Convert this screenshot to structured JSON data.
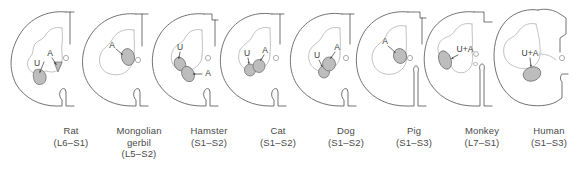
{
  "figure": {
    "type": "anatomical-diagram",
    "nucleus_legend": {
      "U": "U",
      "A": "A",
      "UA": "U+A"
    }
  },
  "panels": [
    {
      "id": "rat",
      "species": "Rat",
      "segments": "(L6–S1)",
      "nuclei": [
        "U",
        "A"
      ],
      "nucleus_labels": [
        "U",
        "A"
      ],
      "separate_nuclei": true
    },
    {
      "id": "mongolian-gerbil",
      "species": "Mongolian gerbil",
      "species_lines": [
        "Mongolian",
        "gerbil"
      ],
      "segments": "(L5–S2)",
      "nuclei": [
        "A"
      ],
      "nucleus_labels": [
        "A"
      ],
      "separate_nuclei": false
    },
    {
      "id": "hamster",
      "species": "Hamster",
      "segments": "(S1–S2)",
      "nuclei": [
        "U",
        "A"
      ],
      "nucleus_labels": [
        "U",
        "A"
      ],
      "separate_nuclei": true
    },
    {
      "id": "cat",
      "species": "Cat",
      "segments": "(S1–S2)",
      "nuclei": [
        "U",
        "A"
      ],
      "nucleus_labels": [
        "U",
        "A"
      ],
      "separate_nuclei": true
    },
    {
      "id": "dog",
      "species": "Dog",
      "segments": "(S1–S2)",
      "nuclei": [
        "U",
        "A"
      ],
      "nucleus_labels": [
        "U",
        "A"
      ],
      "separate_nuclei": true
    },
    {
      "id": "pig",
      "species": "Pig",
      "segments": "(S1–S3)",
      "nuclei": [
        "A"
      ],
      "nucleus_labels": [
        "A"
      ],
      "separate_nuclei": false
    },
    {
      "id": "monkey",
      "species": "Monkey",
      "segments": "(L7–S1)",
      "nuclei": [
        "U+A"
      ],
      "nucleus_labels": [
        "U+A"
      ],
      "separate_nuclei": false
    },
    {
      "id": "human",
      "species": "Human",
      "segments": "(S1–S3)",
      "nuclei": [
        "U+A"
      ],
      "nucleus_labels": [
        "U+A"
      ],
      "separate_nuclei": false
    }
  ],
  "colors": {
    "cord_outline": "#5a5a5a",
    "gray_matter": "#b2b2b2",
    "nucleus_fill": "#bdbdbd",
    "nucleus_stroke": "#6e6e6e",
    "label_text": "#4a4a4a"
  }
}
